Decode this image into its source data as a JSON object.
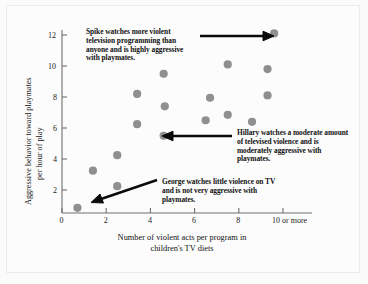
{
  "figure": {
    "background_color": "#fbfbfb",
    "frame_color": "#ececec",
    "dot_color": "#8f8f8f",
    "axis_color": "#6e6e6e",
    "text_color": "#111111"
  },
  "chart_data": {
    "type": "scatter",
    "title": "",
    "xlabel_line1": "Number of violent acts per program in",
    "xlabel_line2": "children's TV diets",
    "ylabel_line1": "Aggressive behavior toward playmates",
    "ylabel_line2": "per hour of play",
    "xlim": [
      0,
      10
    ],
    "ylim": [
      0,
      12
    ],
    "xticks": [
      0,
      2,
      4,
      6,
      8,
      10
    ],
    "xtick_labels": [
      "0",
      "2",
      "4",
      "6",
      "8",
      "10 or more"
    ],
    "yticks": [
      2,
      4,
      6,
      8,
      10,
      12
    ],
    "ytick_labels": [
      "2",
      "4",
      "6",
      "8",
      "10",
      "12"
    ],
    "grid": false,
    "legend": "none",
    "marker": "circle",
    "points": [
      {
        "x": 0.7,
        "y": 0.85,
        "label": "George"
      },
      {
        "x": 1.4,
        "y": 3.25,
        "label": ""
      },
      {
        "x": 2.5,
        "y": 2.25,
        "label": ""
      },
      {
        "x": 2.5,
        "y": 4.25,
        "label": ""
      },
      {
        "x": 3.4,
        "y": 6.25,
        "label": ""
      },
      {
        "x": 3.4,
        "y": 8.2,
        "label": ""
      },
      {
        "x": 4.6,
        "y": 5.5,
        "label": "Hillary"
      },
      {
        "x": 4.65,
        "y": 7.4,
        "label": ""
      },
      {
        "x": 4.6,
        "y": 9.5,
        "label": ""
      },
      {
        "x": 6.5,
        "y": 6.5,
        "label": ""
      },
      {
        "x": 6.7,
        "y": 7.95,
        "label": ""
      },
      {
        "x": 7.5,
        "y": 6.85,
        "label": ""
      },
      {
        "x": 7.5,
        "y": 10.1,
        "label": ""
      },
      {
        "x": 8.6,
        "y": 6.4,
        "label": ""
      },
      {
        "x": 9.3,
        "y": 8.1,
        "label": ""
      },
      {
        "x": 9.3,
        "y": 9.8,
        "label": ""
      },
      {
        "x": 9.6,
        "y": 12.1,
        "label": "Spike"
      }
    ],
    "annotations": [
      {
        "name": "spike",
        "text": "Spike watches more violent television programming than anyone and is highly aggressive with playmates.",
        "arrow_direction": "right",
        "target_point": {
          "x": 9.6,
          "y": 12.1
        }
      },
      {
        "name": "hillary",
        "text": "Hillary watches a moderate amount of televised violence and is moderately aggressive with playmates.",
        "arrow_direction": "left",
        "target_point": {
          "x": 4.6,
          "y": 5.5
        }
      },
      {
        "name": "george",
        "text": "George watches little violence on TV and is not very aggressive with playmates.",
        "arrow_direction": "down-left",
        "target_point": {
          "x": 0.7,
          "y": 0.85
        }
      }
    ]
  }
}
